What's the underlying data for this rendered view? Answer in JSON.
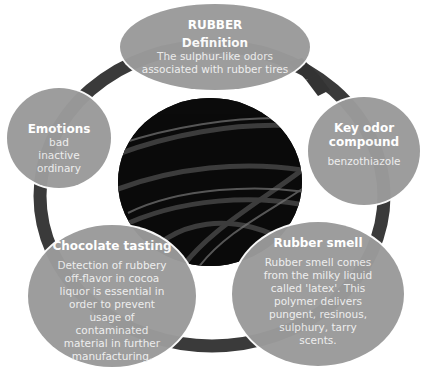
{
  "diagram": {
    "center_image": "black-rubber-tubes-photo",
    "colors": {
      "bubble": "#9a9a9a",
      "ring": "#3a3a3a",
      "arrow": "#333333",
      "text": "#ffffff"
    },
    "definition": {
      "heading": "RUBBER",
      "title": "Definition",
      "body": "The sulphur-like odors associated with rubber tires"
    },
    "emotions": {
      "title": "Emotions",
      "items": [
        "bad",
        "inactive",
        "ordinary"
      ]
    },
    "key_odor": {
      "title": "Key odor compound",
      "body": "benzothiazole"
    },
    "chocolate": {
      "title": "Chocolate tasting",
      "body": "Detection of rubbery off-flavor in cocoa liquor is essential in order to prevent usage of contaminated material in further manufacturing."
    },
    "rubber_smell": {
      "title": "Rubber smell",
      "body": "Rubber smell comes from the milky liquid called 'latex'. This polymer delivers pungent, resinous, sulphury, tarry scents."
    }
  }
}
